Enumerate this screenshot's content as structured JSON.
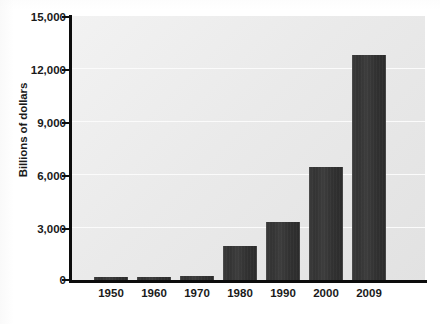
{
  "chart_data": {
    "type": "bar",
    "title": "",
    "xlabel": "",
    "ylabel": "Billions of dollars",
    "categories": [
      "1950",
      "1960",
      "1970",
      "1980",
      "1990",
      "2000",
      "2009"
    ],
    "values": [
      150,
      200,
      250,
      1950,
      3300,
      6400,
      12800
    ],
    "ylim": [
      0,
      15000
    ],
    "ytick_labels": [
      "0",
      "3,000",
      "6,000",
      "9,000",
      "12,000",
      "15,000"
    ],
    "ytick_values": [
      0,
      3000,
      6000,
      9000,
      12000,
      15000
    ],
    "grid": true,
    "legend": "none",
    "bar_color": "#343434",
    "plot_background": "#ececec",
    "axis_color": "#0c0c0c",
    "gridline_color": "#fbfbfb"
  }
}
